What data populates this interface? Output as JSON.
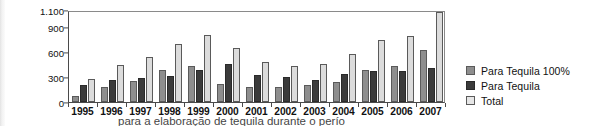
{
  "chart_data": {
    "type": "bar",
    "title": "",
    "subtitle": "",
    "xlabel": "",
    "ylabel": "",
    "grid": false,
    "legend_position": "right",
    "ylim": [
      0,
      1100
    ],
    "yticks": [
      "0",
      "300",
      "600",
      "900",
      "1.100"
    ],
    "ytick_values": [
      0,
      300,
      600,
      900,
      1100
    ],
    "categories": [
      "1995",
      "1996",
      "1997",
      "1998",
      "1999",
      "2000",
      "2001",
      "2002",
      "2003",
      "2004",
      "2005",
      "2006",
      "2007"
    ],
    "series": [
      {
        "name": "Para Tequila 100%",
        "color": "#8e8e8e",
        "values": [
          75,
          175,
          250,
          385,
          425,
          210,
          180,
          180,
          205,
          245,
          385,
          430,
          620
        ]
      },
      {
        "name": "Para Tequila",
        "color": "#3b3b3b",
        "values": [
          205,
          265,
          285,
          310,
          380,
          450,
          320,
          300,
          265,
          335,
          375,
          365,
          405
        ]
      },
      {
        "name": "Total",
        "color": "#dcdcdc",
        "values": [
          280,
          440,
          535,
          690,
          805,
          645,
          480,
          435,
          450,
          580,
          740,
          790,
          1080
        ]
      }
    ]
  },
  "legend": {
    "items": [
      {
        "label": "Para Tequila 100%"
      },
      {
        "label": "Para Tequila"
      },
      {
        "label": "Total"
      }
    ]
  },
  "caption": {
    "text": "para a elaboração de tequila durante o perío"
  }
}
